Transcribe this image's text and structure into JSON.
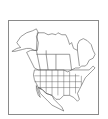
{
  "map": {
    "title": "North America outline map",
    "region": "North America",
    "countries": [
      "Canada",
      "United States",
      "Mexico"
    ],
    "style": "black-and-white outline with state and province boundaries",
    "colors": {
      "background": "#ffffff",
      "stroke": "#555555",
      "frame": "#8a8a8a"
    }
  }
}
